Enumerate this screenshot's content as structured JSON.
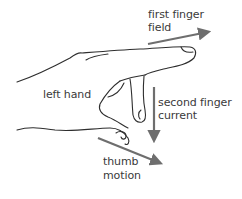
{
  "diagram": {
    "colors": {
      "outline": "#2e2e2e",
      "arrow": "#6e6e6e",
      "text": "#3a3a3a",
      "background": "#ffffff"
    },
    "labels": {
      "hand": "left hand",
      "first_finger_line1": "first finger",
      "first_finger_line2": "field",
      "second_finger_line1": "second finger",
      "second_finger_line2": "current",
      "thumb_line1": "thumb",
      "thumb_line2": "motion"
    },
    "arrows": [
      {
        "name": "field",
        "direction": "right",
        "from": [
          148,
          44
        ],
        "to": [
          213,
          31
        ]
      },
      {
        "name": "current",
        "direction": "down",
        "from": [
          154,
          87
        ],
        "to": [
          154,
          146
        ]
      },
      {
        "name": "motion",
        "direction": "down-right",
        "from": [
          98,
          138
        ],
        "to": [
          166,
          166
        ]
      }
    ]
  }
}
